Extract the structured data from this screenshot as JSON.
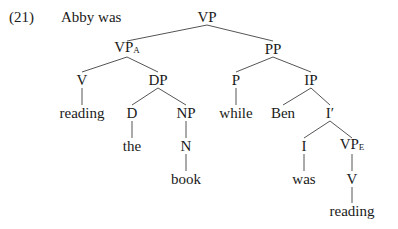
{
  "example": {
    "number": "(21)",
    "prefix": "Abby was"
  },
  "colors": {
    "line": "#555555",
    "text": "#1a1a1a"
  },
  "nodes": [
    {
      "id": "vp",
      "label": "VP",
      "sub": "",
      "x": 207,
      "y": 17
    },
    {
      "id": "vpa",
      "label": "VP",
      "sub": "A",
      "x": 127,
      "y": 49
    },
    {
      "id": "pp",
      "label": "PP",
      "sub": "",
      "x": 273,
      "y": 49
    },
    {
      "id": "v1",
      "label": "V",
      "sub": "",
      "x": 82,
      "y": 80
    },
    {
      "id": "dp",
      "label": "DP",
      "sub": "",
      "x": 158,
      "y": 80
    },
    {
      "id": "p",
      "label": "P",
      "sub": "",
      "x": 236,
      "y": 80
    },
    {
      "id": "ip",
      "label": "IP",
      "sub": "",
      "x": 311,
      "y": 80
    },
    {
      "id": "reading1",
      "label": "reading",
      "sub": "",
      "x": 82,
      "y": 113
    },
    {
      "id": "d",
      "label": "D",
      "sub": "",
      "x": 132,
      "y": 113
    },
    {
      "id": "np",
      "label": "NP",
      "sub": "",
      "x": 186,
      "y": 113
    },
    {
      "id": "while",
      "label": "while",
      "sub": "",
      "x": 236,
      "y": 113
    },
    {
      "id": "ben",
      "label": "Ben",
      "sub": "",
      "x": 283,
      "y": 113
    },
    {
      "id": "ibar",
      "label": "I′",
      "sub": "",
      "x": 330,
      "y": 113
    },
    {
      "id": "the",
      "label": "the",
      "sub": "",
      "x": 132,
      "y": 146
    },
    {
      "id": "n",
      "label": "N",
      "sub": "",
      "x": 186,
      "y": 146
    },
    {
      "id": "i",
      "label": "I",
      "sub": "",
      "x": 304,
      "y": 146
    },
    {
      "id": "vpe",
      "label": "VP",
      "sub": "E",
      "x": 352,
      "y": 146
    },
    {
      "id": "book",
      "label": "book",
      "sub": "",
      "x": 186,
      "y": 179
    },
    {
      "id": "was",
      "label": "was",
      "sub": "",
      "x": 304,
      "y": 179
    },
    {
      "id": "v2",
      "label": "V",
      "sub": "",
      "x": 352,
      "y": 179
    },
    {
      "id": "reading2",
      "label": "reading",
      "sub": "",
      "x": 352,
      "y": 211
    }
  ],
  "edges": [
    [
      "vp",
      "vpa"
    ],
    [
      "vp",
      "pp"
    ],
    [
      "vpa",
      "v1"
    ],
    [
      "vpa",
      "dp"
    ],
    [
      "pp",
      "p"
    ],
    [
      "pp",
      "ip"
    ],
    [
      "v1",
      "reading1"
    ],
    [
      "dp",
      "d"
    ],
    [
      "dp",
      "np"
    ],
    [
      "p",
      "while"
    ],
    [
      "ip",
      "ben"
    ],
    [
      "ip",
      "ibar"
    ],
    [
      "d",
      "the"
    ],
    [
      "np",
      "n"
    ],
    [
      "ibar",
      "i"
    ],
    [
      "ibar",
      "vpe"
    ],
    [
      "n",
      "book"
    ],
    [
      "i",
      "was"
    ],
    [
      "vpe",
      "v2"
    ],
    [
      "v2",
      "reading2"
    ]
  ]
}
